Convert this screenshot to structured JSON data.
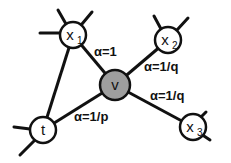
{
  "diagram": {
    "type": "node2vec-random-walk",
    "nodes": [
      {
        "id": "x1",
        "label": "x",
        "sub": "1",
        "cx": 73,
        "cy": 35,
        "r": 13,
        "fill": "#ffffff"
      },
      {
        "id": "x2",
        "label": "x",
        "sub": "2",
        "cx": 168,
        "cy": 40,
        "r": 13,
        "fill": "#ffffff"
      },
      {
        "id": "x3",
        "label": "x",
        "sub": "3",
        "cx": 193,
        "cy": 127,
        "r": 13,
        "fill": "#ffffff"
      },
      {
        "id": "t",
        "label": "t",
        "sub": "",
        "cx": 43,
        "cy": 130,
        "r": 13,
        "fill": "#ffffff"
      },
      {
        "id": "v",
        "label": "v",
        "sub": "",
        "cx": 115,
        "cy": 85,
        "r": 15,
        "fill": "#9e9e9e"
      }
    ],
    "edges": [
      {
        "from": "x1",
        "to": "v"
      },
      {
        "from": "x1",
        "to": "t"
      },
      {
        "from": "v",
        "to": "x2"
      },
      {
        "from": "v",
        "to": "x3"
      },
      {
        "from": "v",
        "to": "t"
      }
    ],
    "edge_labels": [
      {
        "text": "α=1",
        "x": 94,
        "y": 56
      },
      {
        "text": "α=1/q",
        "x": 144,
        "y": 71
      },
      {
        "text": "α=1/q",
        "x": 150,
        "y": 100
      },
      {
        "text": "α=1/p",
        "x": 74,
        "y": 121
      }
    ],
    "stubs": [
      [
        40,
        33,
        60,
        33
      ],
      [
        58,
        10,
        66,
        24
      ],
      [
        92,
        12,
        82,
        24
      ],
      [
        154,
        16,
        161,
        29
      ],
      [
        188,
        18,
        177,
        30
      ],
      [
        206,
        112,
        199,
        119
      ],
      [
        210,
        140,
        201,
        134
      ],
      [
        14,
        127,
        30,
        129
      ],
      [
        20,
        155,
        34,
        141
      ]
    ],
    "colors": {
      "stroke": "#111111",
      "node_fill": "#ffffff",
      "center_fill": "#9e9e9e"
    }
  }
}
